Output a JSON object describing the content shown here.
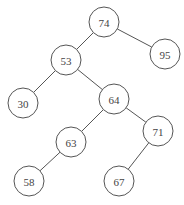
{
  "diagram": {
    "type": "binary-search-tree",
    "node_radius": 15,
    "nodes": [
      {
        "id": "n74",
        "label": "74",
        "x": 104,
        "y": 22
      },
      {
        "id": "n53",
        "label": "53",
        "x": 66,
        "y": 60
      },
      {
        "id": "n95",
        "label": "95",
        "x": 165,
        "y": 54
      },
      {
        "id": "n30",
        "label": "30",
        "x": 23,
        "y": 103
      },
      {
        "id": "n64",
        "label": "64",
        "x": 114,
        "y": 99
      },
      {
        "id": "n63",
        "label": "63",
        "x": 71,
        "y": 142
      },
      {
        "id": "n71",
        "label": "71",
        "x": 158,
        "y": 131
      },
      {
        "id": "n58",
        "label": "58",
        "x": 29,
        "y": 181
      },
      {
        "id": "n67",
        "label": "67",
        "x": 119,
        "y": 181
      }
    ],
    "edges": [
      {
        "from": "n74",
        "to": "n53"
      },
      {
        "from": "n74",
        "to": "n95"
      },
      {
        "from": "n53",
        "to": "n30"
      },
      {
        "from": "n53",
        "to": "n64"
      },
      {
        "from": "n64",
        "to": "n63"
      },
      {
        "from": "n64",
        "to": "n71"
      },
      {
        "from": "n63",
        "to": "n58"
      },
      {
        "from": "n71",
        "to": "n67"
      }
    ]
  }
}
